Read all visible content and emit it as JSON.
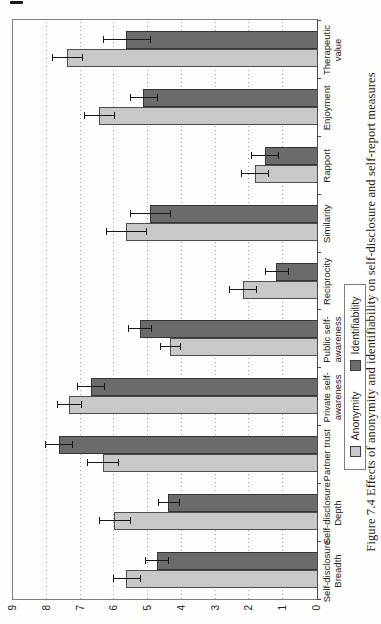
{
  "page": {
    "background": "#ffffff"
  },
  "figure": {
    "caption": "Figure 7.4 Effects of anonymity and identifiability on self-disclosure and self-report measures"
  },
  "axis": {
    "tick_labels": [
      "0",
      "1",
      "2",
      "3",
      "4",
      "5",
      "6",
      "7",
      "8",
      "9"
    ]
  },
  "legend": {
    "items": [
      {
        "label": "Anonymity",
        "color": "#c8c8c8"
      },
      {
        "label": "Identifiability",
        "color": "#6b6b6b"
      }
    ]
  },
  "chart_data": {
    "type": "bar",
    "title": "",
    "xlabel": "",
    "ylabel": "",
    "note": "Clustered column chart with error bars, printed rotated 90 degrees counter-clockwise on a portrait book page",
    "categories": [
      "Self-disclosure Breadth",
      "Self-disclosure Depth",
      "Partner trust",
      "Private self-awareness",
      "Public self-awareness",
      "Reciprocity",
      "Similarity",
      "Rapport",
      "Enjoyment",
      "Therapeutic value"
    ],
    "category_label_lines": [
      [
        "Self-disclosure",
        "Breadth"
      ],
      [
        "Self-disclosure",
        "Depth"
      ],
      [
        "Partner trust"
      ],
      [
        "Private self-",
        "awareness"
      ],
      [
        "Public self-",
        "awareness"
      ],
      [
        "Reciprocity"
      ],
      [
        "Similarity"
      ],
      [
        "Rapport"
      ],
      [
        "Enjoyment"
      ],
      [
        "Therapeutic",
        "value"
      ]
    ],
    "series": [
      {
        "name": "Anonymity",
        "color": "#c8c8c8",
        "border_color": "#4d4d4d",
        "values": [
          5.65,
          6.0,
          6.35,
          7.35,
          4.35,
          2.2,
          5.65,
          1.85,
          6.45,
          7.4
        ],
        "errors": [
          0.4,
          0.45,
          0.45,
          0.35,
          0.3,
          0.4,
          0.6,
          0.4,
          0.45,
          0.45
        ]
      },
      {
        "name": "Identifiability",
        "color": "#6b6b6b",
        "border_color": "#343434",
        "values": [
          4.75,
          4.4,
          7.65,
          6.7,
          5.25,
          1.2,
          4.95,
          1.55,
          5.15,
          5.65
        ],
        "errors": [
          0.35,
          0.3,
          0.4,
          0.4,
          0.35,
          0.35,
          0.6,
          0.4,
          0.4,
          0.7
        ]
      }
    ],
    "ylim": [
      0,
      9
    ],
    "yticks": [
      0,
      1,
      2,
      3,
      4,
      5,
      6,
      7,
      8,
      9
    ],
    "grid": "dotted gridline at each integer value",
    "legend_position": "boxed, below category labels",
    "error_bars": true
  }
}
